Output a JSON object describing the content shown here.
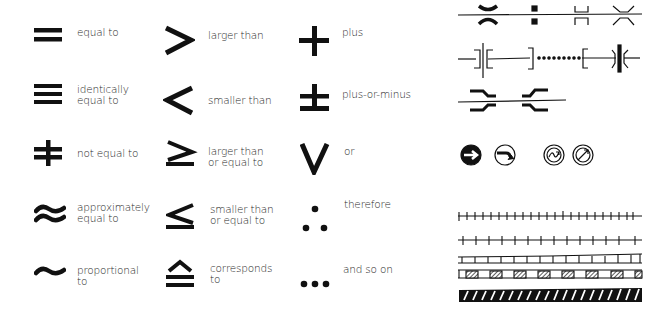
{
  "math_symbols": {
    "column1": [
      {
        "symbol": "equal-to",
        "label": "equal to"
      },
      {
        "symbol": "identically-equal-to",
        "label": "identically\nequal to"
      },
      {
        "symbol": "not-equal-to",
        "label": "not equal to"
      },
      {
        "symbol": "approximately-equal-to",
        "label": "approximately\nequal to"
      },
      {
        "symbol": "proportional-to",
        "label": "proportional\nto"
      }
    ],
    "column2": [
      {
        "symbol": "larger-than",
        "label": "larger than"
      },
      {
        "symbol": "smaller-than",
        "label": "smaller than"
      },
      {
        "symbol": "larger-than-or-equal-to",
        "label": "larger than\nor equal to"
      },
      {
        "symbol": "smaller-than-or-equal-to",
        "label": "smaller than\nor equal to"
      },
      {
        "symbol": "corresponds-to",
        "label": "corresponds\nto"
      }
    ],
    "column3": [
      {
        "symbol": "plus",
        "label": "plus"
      },
      {
        "symbol": "plus-or-minus",
        "label": "plus-or-minus"
      },
      {
        "symbol": "or",
        "label": "or"
      },
      {
        "symbol": "therefore",
        "label": "therefore"
      },
      {
        "symbol": "and-so-on",
        "label": "and so on"
      }
    ]
  },
  "technical_symbols": {
    "line_symbols_row1": [
      "bearing-on-shaft",
      "square-marks",
      "bracket-joint",
      "flared-joint"
    ],
    "line_symbols_row2": [
      "flange-coupling",
      "dotted-section",
      "bolted-coupling"
    ],
    "line_symbols_row3": [
      "offset-joints"
    ],
    "circle_icons": [
      "filled-arrow-circle",
      "curved-arrow-circle",
      "spiral-double-circle",
      "arrow-double-circle"
    ],
    "track_patterns": [
      "tick-track",
      "cross-tick-track",
      "ladder-track",
      "hatched-block-track",
      "striped-bar-track"
    ]
  },
  "colors": {
    "ink": "#1a1a1a",
    "background": "#ffffff"
  }
}
